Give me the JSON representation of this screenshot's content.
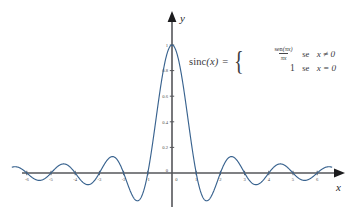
{
  "figure": {
    "background_color": "#ffffff",
    "curve_color": "#39638f",
    "axis_color": "#55565a",
    "text_color": "#3a3a3a"
  },
  "axes": {
    "x_label": "x",
    "y_label": "y",
    "x_ticks": [
      "-6",
      "-5",
      "-4",
      "-3",
      "-2",
      "-1",
      "0",
      "1",
      "2",
      "3",
      "4",
      "5",
      "6"
    ],
    "y_ticks": [
      "0",
      "0.2",
      "0.4",
      "0.6",
      "0.8",
      "1"
    ]
  },
  "formula": {
    "function_name": "sinc",
    "argument": "(x)",
    "equals": "=",
    "brace": "{",
    "case1": {
      "numerator_fn": "sen",
      "numerator_arg": "(πx)",
      "denominator": "πx",
      "word": "se",
      "condition": "x ≠ 0"
    },
    "case2": {
      "value": "1",
      "word": "se",
      "condition": "x = 0"
    }
  },
  "chart_data": {
    "type": "line",
    "title": "",
    "xlabel": "x",
    "ylabel": "y",
    "xlim": [
      -6.6,
      6.6
    ],
    "ylim": [
      -0.28,
      1.05
    ],
    "grid": false,
    "legend": null,
    "series": [
      {
        "name": "sinc(x) = sen(pi*x)/(pi*x)",
        "formula": "sin(pi*x)/(pi*x)",
        "color": "#39638f",
        "key_points": [
          {
            "x": -6.0,
            "y": 0.0
          },
          {
            "x": -5.5,
            "y": -0.0579
          },
          {
            "x": -5.0,
            "y": 0.0
          },
          {
            "x": -4.5,
            "y": 0.0707
          },
          {
            "x": -4.0,
            "y": 0.0
          },
          {
            "x": -3.5,
            "y": -0.0909
          },
          {
            "x": -3.0,
            "y": 0.0
          },
          {
            "x": -2.5,
            "y": 0.1273
          },
          {
            "x": -2.0,
            "y": 0.0
          },
          {
            "x": -1.5,
            "y": -0.2122
          },
          {
            "x": -1.0,
            "y": 0.0
          },
          {
            "x": -0.5,
            "y": 0.6366
          },
          {
            "x": 0.0,
            "y": 1.0
          },
          {
            "x": 0.5,
            "y": 0.6366
          },
          {
            "x": 1.0,
            "y": 0.0
          },
          {
            "x": 1.5,
            "y": -0.2122
          },
          {
            "x": 2.0,
            "y": 0.0
          },
          {
            "x": 2.5,
            "y": 0.1273
          },
          {
            "x": 3.0,
            "y": 0.0
          },
          {
            "x": 3.5,
            "y": -0.0909
          },
          {
            "x": 4.0,
            "y": 0.0
          },
          {
            "x": 4.5,
            "y": 0.0707
          },
          {
            "x": 5.0,
            "y": 0.0
          },
          {
            "x": 5.5,
            "y": -0.0579
          },
          {
            "x": 6.0,
            "y": 0.0
          }
        ]
      }
    ]
  }
}
